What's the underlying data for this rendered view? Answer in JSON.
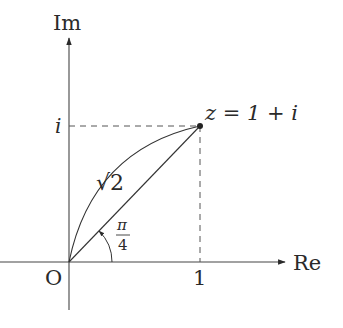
{
  "diagram": {
    "type": "complex-plane",
    "axes": {
      "x_label": "Re",
      "y_label": "Im",
      "origin_label": "O"
    },
    "ticks": {
      "x_tick": "1",
      "y_tick": "i"
    },
    "point": {
      "label": "z = 1 + i",
      "re": 1,
      "im": 1
    },
    "modulus_label": "√2",
    "angle_label": {
      "numerator": "π",
      "denominator": "4"
    },
    "colors": {
      "ink": "#2a2a2a",
      "dashed": "#555555",
      "background": "#ffffff"
    }
  }
}
